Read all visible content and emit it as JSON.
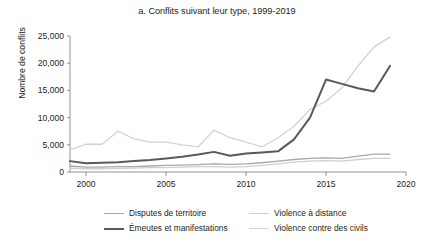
{
  "chart_data": {
    "type": "line",
    "title": "a. Conflits suivant leur type, 1999-2019",
    "xlabel": "",
    "ylabel": "Nombre de conflits",
    "xlim": [
      1999,
      2020
    ],
    "ylim": [
      0,
      25000
    ],
    "xticks": [
      2000,
      2005,
      2010,
      2015,
      2020
    ],
    "xtick_labels": [
      "2000",
      "2005",
      "2010",
      "2015",
      "2020"
    ],
    "yticks": [
      0,
      5000,
      10000,
      15000,
      20000,
      25000
    ],
    "ytick_labels": [
      "0",
      "5,000",
      "10,000",
      "15,000",
      "20,000",
      "25,000"
    ],
    "grid": false,
    "legend_position": "bottom",
    "x": [
      1999,
      2000,
      2001,
      2002,
      2003,
      2004,
      2005,
      2006,
      2007,
      2008,
      2009,
      2010,
      2011,
      2012,
      2013,
      2014,
      2015,
      2016,
      2017,
      2018,
      2019
    ],
    "series": [
      {
        "name": "Disputes de territoire",
        "color": "#a8a8a8",
        "width": 1.3,
        "values": [
          1100,
          900,
          900,
          1000,
          1000,
          1100,
          1200,
          1250,
          1350,
          1500,
          1400,
          1500,
          1700,
          2000,
          2300,
          2500,
          2600,
          2500,
          2900,
          3300,
          3300
        ]
      },
      {
        "name": "Violence à distance",
        "color": "#cfcfcf",
        "width": 1.3,
        "values": [
          700,
          600,
          600,
          650,
          700,
          800,
          800,
          900,
          1000,
          1000,
          900,
          1000,
          1200,
          1500,
          1800,
          2000,
          2100,
          2000,
          2300,
          2500,
          2500
        ]
      },
      {
        "name": "Émeutes et manifestations",
        "color": "#595959",
        "width": 2.0,
        "values": [
          2000,
          1600,
          1700,
          1800,
          2000,
          2200,
          2500,
          2800,
          3200,
          3700,
          3000,
          3400,
          3600,
          3800,
          6000,
          10000,
          17000,
          16200,
          15400,
          14800,
          19500
        ]
      },
      {
        "name": "Violence contre des civils",
        "color": "#d2d2d2",
        "width": 1.3,
        "values": [
          4100,
          5100,
          5100,
          7500,
          6100,
          5500,
          5500,
          5000,
          4600,
          7700,
          6300,
          5500,
          4600,
          6300,
          8400,
          11500,
          13000,
          15500,
          19500,
          23000,
          24800
        ]
      }
    ]
  },
  "legend": {
    "items": [
      {
        "label": "Disputes de territoire",
        "color": "#a8a8a8",
        "width": 1.6
      },
      {
        "label": "Violence à distance",
        "color": "#cfcfcf",
        "width": 1.6
      },
      {
        "label": "Émeutes et manifestations",
        "color": "#595959",
        "width": 2.4
      },
      {
        "label": "Violence contre des civils",
        "color": "#d2d2d2",
        "width": 1.6
      }
    ]
  }
}
